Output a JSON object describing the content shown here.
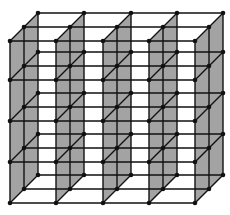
{
  "diagram": {
    "type": "3d-lattice-grid",
    "canvas": {
      "width": 230,
      "height": 215,
      "background": "#ffffff"
    },
    "colors": {
      "line": "#111111",
      "node": "#111111",
      "panel_fill": "#a3a3a3"
    },
    "columns_x": [
      10,
      56,
      103,
      149,
      195
    ],
    "rows_y": [
      41,
      80,
      121,
      162,
      203
    ],
    "depth_layers": [
      {
        "name": "front",
        "dx": 0,
        "dy": 0
      },
      {
        "name": "middle",
        "dx": 14,
        "dy": -14
      },
      {
        "name": "back",
        "dx": 28,
        "dy": -28
      }
    ],
    "shaded_planes_at_columns": [
      0,
      1,
      2,
      3,
      4
    ],
    "node_radius": 2.3,
    "line_width": 1.4
  }
}
